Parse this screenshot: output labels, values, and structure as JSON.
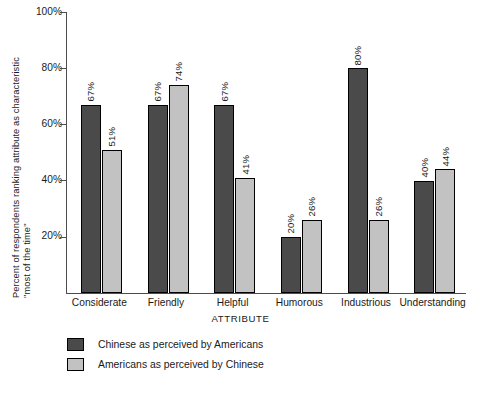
{
  "chart_data": {
    "type": "bar",
    "title": "",
    "xlabel": "ATTRIBUTE",
    "ylabel": "Percent of respondents ranking attribute as characteristic \"most of the time\"",
    "ylabel_line1": "Percent of respondents ranking attribute as characteristic",
    "ylabel_line2": "\"most of the time\"",
    "categories": [
      "Considerate",
      "Friendly",
      "Helpful",
      "Humorous",
      "Industrious",
      "Understanding"
    ],
    "series": [
      {
        "name": "Chinese as perceived by Americans",
        "color": "#4a4a4a",
        "values": [
          67,
          67,
          67,
          20,
          80,
          40
        ],
        "value_labels": [
          "67%",
          "67%",
          "67%",
          "20%",
          "80%",
          "40%"
        ]
      },
      {
        "name": "Americans as perceived by Chinese",
        "color": "#c2c2c2",
        "values": [
          51,
          74,
          41,
          26,
          26,
          44
        ],
        "value_labels": [
          "51%",
          "74%",
          "41%",
          "26%",
          "26%",
          "44%"
        ]
      }
    ],
    "ylim": [
      0,
      100
    ],
    "ytick_values": [
      20,
      40,
      60,
      80,
      100
    ],
    "ytick_labels": [
      "20%",
      "40%",
      "60%",
      "80%",
      "100%"
    ],
    "grid": false,
    "legend_position": "below-plot-left",
    "value_labels_rotated": true
  },
  "caption_sliver": "",
  "icons": {
    "legend_swatch_dark": "filled-square-dark",
    "legend_swatch_light": "filled-square-light"
  }
}
